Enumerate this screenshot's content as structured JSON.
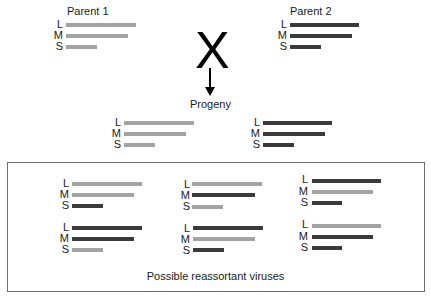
{
  "colors": {
    "parent1": "#a3a3a3",
    "parent2": "#3b3b3b"
  },
  "parent1": {
    "title": "Parent 1",
    "segments": [
      {
        "label": "L",
        "source": "parent1"
      },
      {
        "label": "M",
        "source": "parent1"
      },
      {
        "label": "S",
        "source": "parent1"
      }
    ]
  },
  "parent2": {
    "title": "Parent 2",
    "segments": [
      {
        "label": "L",
        "source": "parent2"
      },
      {
        "label": "M",
        "source": "parent2"
      },
      {
        "label": "S",
        "source": "parent2"
      }
    ]
  },
  "cross_symbol": "X",
  "progeny": {
    "title": "Progeny",
    "left": {
      "segments": [
        {
          "label": "L",
          "source": "parent1"
        },
        {
          "label": "M",
          "source": "parent1"
        },
        {
          "label": "S",
          "source": "parent1"
        }
      ]
    },
    "right": {
      "segments": [
        {
          "label": "L",
          "source": "parent2"
        },
        {
          "label": "M",
          "source": "parent2"
        },
        {
          "label": "S",
          "source": "parent2"
        }
      ]
    }
  },
  "reassortants": {
    "caption": "Possible reassortant viruses",
    "viruses": [
      {
        "segments": [
          {
            "label": "L",
            "source": "parent1"
          },
          {
            "label": "M",
            "source": "parent1"
          },
          {
            "label": "S",
            "source": "parent2"
          }
        ]
      },
      {
        "segments": [
          {
            "label": "L",
            "source": "parent1"
          },
          {
            "label": "M",
            "source": "parent2"
          },
          {
            "label": "S",
            "source": "parent1"
          }
        ]
      },
      {
        "segments": [
          {
            "label": "L",
            "source": "parent2"
          },
          {
            "label": "M",
            "source": "parent1"
          },
          {
            "label": "S",
            "source": "parent2"
          }
        ]
      },
      {
        "segments": [
          {
            "label": "L",
            "source": "parent2"
          },
          {
            "label": "M",
            "source": "parent2"
          },
          {
            "label": "S",
            "source": "parent1"
          }
        ]
      },
      {
        "segments": [
          {
            "label": "L",
            "source": "parent2"
          },
          {
            "label": "M",
            "source": "parent1"
          },
          {
            "label": "S",
            "source": "parent2"
          }
        ]
      },
      {
        "segments": [
          {
            "label": "L",
            "source": "parent1"
          },
          {
            "label": "M",
            "source": "parent2"
          },
          {
            "label": "S",
            "source": "parent2"
          }
        ]
      }
    ]
  }
}
